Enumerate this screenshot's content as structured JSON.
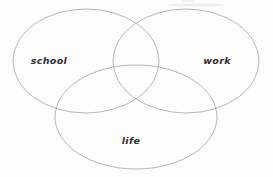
{
  "diagram": {
    "type": "venn",
    "title": "",
    "background_color": "#fdfdfd",
    "stroke_color": "#a9a9ae",
    "label_color": "#2e2e30",
    "set_count": 3,
    "sets": [
      {
        "id": "school",
        "label": "school",
        "position": "left",
        "label_x": 49,
        "label_y": 61,
        "cx": 86,
        "cy": 61,
        "rx": 73,
        "ry": 52
      },
      {
        "id": "work",
        "label": "work",
        "position": "right",
        "label_x": 217,
        "label_y": 61,
        "cx": 186,
        "cy": 61,
        "rx": 73,
        "ry": 52
      },
      {
        "id": "life",
        "label": "life",
        "position": "bottom",
        "label_x": 131,
        "label_y": 141,
        "cx": 136,
        "cy": 117,
        "rx": 81,
        "ry": 52
      }
    ],
    "artifacts": [
      {
        "id": "top-smudge",
        "x": 196,
        "y": 5,
        "rx": 30,
        "ry": 1.6
      },
      {
        "id": "top-dot",
        "x": 188,
        "y": 1,
        "rx": 6,
        "ry": 1.1
      }
    ]
  }
}
